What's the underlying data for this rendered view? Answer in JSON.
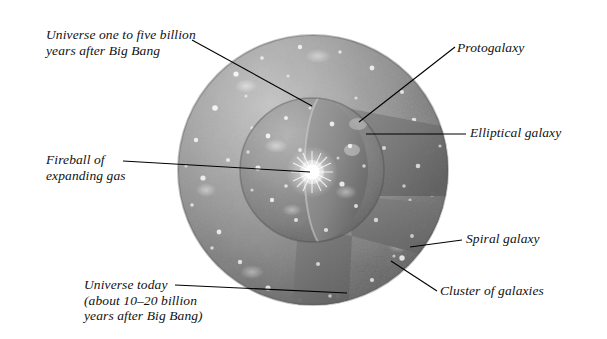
{
  "figure": {
    "background_color": "#ffffff",
    "width": 607,
    "height": 339
  },
  "labels": {
    "universe_early": "Universe one to five billion\nyears after Big Bang",
    "fireball": "Fireball of\nexpanding gas",
    "universe_today": "Universe today\n(about 10–20 billion\nyears after Big Bang)",
    "protogalaxy": "Protogalaxy",
    "elliptical_galaxy": "Elliptical galaxy",
    "spiral_galaxy": "Spiral galaxy",
    "cluster_of_galaxies": "Cluster of galaxies"
  },
  "diagram": {
    "outer_sphere": {
      "name": "universe-today-sphere",
      "center_x": 313,
      "center_y": 170,
      "radius": 135,
      "fill_light": "#a9a9a9",
      "fill_dark": "#5e5e5e"
    },
    "inner_sphere": {
      "name": "early-universe-sphere",
      "center_x": 312,
      "center_y": 170,
      "radius": 72,
      "fill_light": "#9a9a9a",
      "fill_dark": "#565656"
    },
    "fireball": {
      "name": "fireball-core",
      "center_x": 312,
      "center_y": 172,
      "glow_color": "#ffffff"
    },
    "leader_lines": [
      {
        "name": "leader-universe-early",
        "x1": 192,
        "y1": 40,
        "x2": 312,
        "y2": 106
      },
      {
        "name": "leader-fireball",
        "x1": 123,
        "y1": 161,
        "x2": 310,
        "y2": 172
      },
      {
        "name": "leader-universe-today",
        "x1": 175,
        "y1": 285,
        "x2": 347,
        "y2": 293
      },
      {
        "name": "leader-protogalaxy",
        "x1": 455,
        "y1": 47,
        "x2": 359,
        "y2": 122
      },
      {
        "name": "leader-elliptical",
        "x1": 466,
        "y1": 134,
        "x2": 366,
        "y2": 134
      },
      {
        "name": "leader-spiral",
        "x1": 462,
        "y1": 240,
        "x2": 410,
        "y2": 247
      },
      {
        "name": "leader-cluster",
        "x1": 437,
        "y1": 291,
        "x2": 391,
        "y2": 261
      }
    ],
    "line_color": "#000000"
  }
}
